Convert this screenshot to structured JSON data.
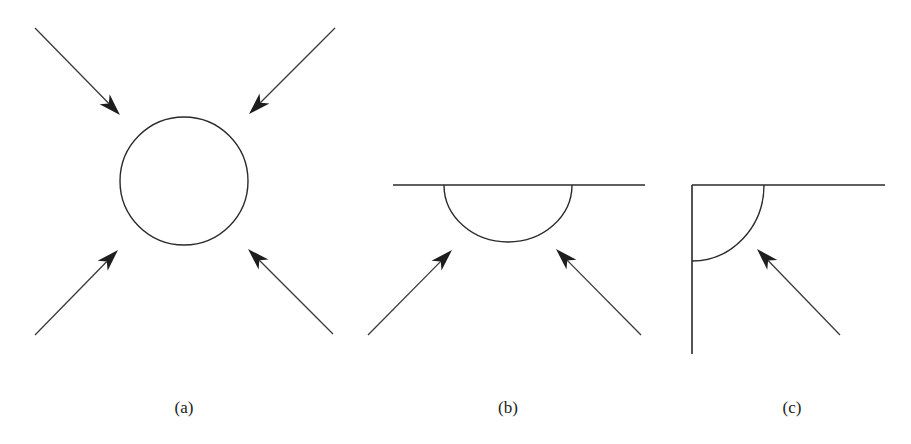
{
  "figure": {
    "panels": [
      {
        "id": "a",
        "caption": "(a)",
        "caption_x": 184,
        "description": "Isolated sphere (circle) with four arrows pointing inward from all diagonal directions",
        "shape": {
          "type": "circle",
          "cx": 184,
          "cy": 181,
          "r": 64
        },
        "arrows": [
          {
            "from": [
              35,
              28
            ],
            "to": [
              120,
              115
            ]
          },
          {
            "from": [
              335,
              28
            ],
            "to": [
              249,
              114
            ]
          },
          {
            "from": [
              35,
              335
            ],
            "to": [
              118,
              250
            ]
          },
          {
            "from": [
              333,
              334
            ],
            "to": [
              248,
              249
            ]
          }
        ]
      },
      {
        "id": "b",
        "caption": "(b)",
        "caption_x": 508,
        "description": "Hemisphere attached to a flat surface with two arrows pointing in from below",
        "surface": {
          "x1": 393,
          "y1": 185,
          "x2": 645,
          "y2": 185
        },
        "shape": {
          "type": "semicircle",
          "cx": 508,
          "cy": 185,
          "rx": 64,
          "ry": 57
        },
        "arrows": [
          {
            "from": [
              368,
              335
            ],
            "to": [
              452,
              250
            ]
          },
          {
            "from": [
              641,
              335
            ],
            "to": [
              556,
              249
            ]
          }
        ]
      },
      {
        "id": "c",
        "caption": "(c)",
        "caption_x": 792,
        "description": "Quarter-sphere in a corner formed by two perpendicular surfaces with one arrow pointing in",
        "surfaces": [
          {
            "x1": 692,
            "y1": 185,
            "x2": 885,
            "y2": 185
          },
          {
            "x1": 692,
            "y1": 185,
            "x2": 692,
            "y2": 354
          }
        ],
        "shape": {
          "type": "quarter-arc",
          "start": [
            764,
            185
          ],
          "end": [
            692,
            261
          ],
          "rx": 72,
          "ry": 76
        },
        "arrows": [
          {
            "from": [
              840,
              335
            ],
            "to": [
              757,
              249
            ]
          }
        ]
      }
    ],
    "colors": {
      "stroke": "#2a2a2a",
      "arrowhead": "#1e1e1e",
      "background": "#ffffff"
    }
  }
}
